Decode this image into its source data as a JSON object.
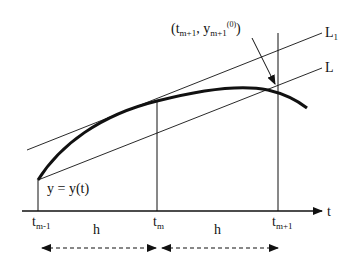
{
  "diagram": {
    "axis_label": "t",
    "curve_label": "y = y(t)",
    "line_labels": {
      "L1": {
        "base": "L",
        "sub": "1"
      },
      "L": {
        "base": "L"
      }
    },
    "ticks": [
      {
        "base": "t",
        "sub": "m-1"
      },
      {
        "base": "t",
        "sub": "m"
      },
      {
        "base": "t",
        "sub": "m+1"
      }
    ],
    "step_labels": [
      "h",
      "h"
    ],
    "annotation": {
      "open": "(t",
      "sub1": "m+1",
      "comma": ", y",
      "sub2": "m+1",
      "sup": "(0)",
      "close": ")"
    },
    "colors": {
      "ink": "#111111",
      "background": "#ffffff"
    }
  }
}
